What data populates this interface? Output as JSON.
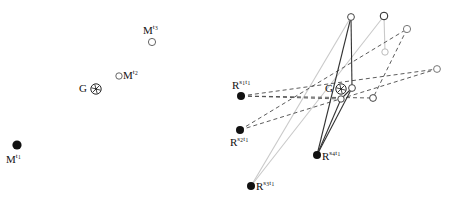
{
  "figure": {
    "type": "diagram",
    "kind": "point-set-correspondence-diagram",
    "background": "#ffffff",
    "width": 454,
    "height": 203,
    "panels": [
      "left",
      "right"
    ]
  },
  "colors": {
    "ink": "#111111",
    "solid_edge": "#333333",
    "dashed_edge": "#4a4a4a",
    "light_edge": "#c9c9c9",
    "open_marker_stroke": "#555555",
    "filled_marker": "#111111",
    "panel_bg": "#ffffff"
  },
  "left_panel": {
    "name": "left-panel",
    "markers": [
      {
        "id": "M-t1",
        "label_base": "M",
        "label_sup": "t",
        "label_sub": "1",
        "style": "filled-circle",
        "x": 17,
        "y": 145,
        "r": 4.6,
        "label_x": 6,
        "label_y": 153
      },
      {
        "id": "G-star",
        "label_base": "G",
        "label_sup": "",
        "label_sub": "",
        "style": "circled-asterisk",
        "x": 96,
        "y": 89,
        "r": 5.2,
        "label_x": 79,
        "label_y": 83
      },
      {
        "id": "M-t2",
        "label_base": "M",
        "label_sup": "t",
        "label_sub": "2",
        "style": "open-circle",
        "x": 119,
        "y": 76,
        "r": 3.2,
        "label_x": 123,
        "label_y": 69
      },
      {
        "id": "M-t3",
        "label_base": "M",
        "label_sup": "t",
        "label_sub": "3",
        "style": "open-circle",
        "x": 152,
        "y": 42,
        "r": 3.6,
        "label_x": 143,
        "label_y": 24
      }
    ]
  },
  "right_panel": {
    "name": "right-panel",
    "markers": [
      {
        "id": "R-s1t1",
        "label_base": "R",
        "label_sup": "s",
        "label_sub": "1",
        "label_sup2": "t",
        "label_sub2": "1",
        "style": "filled-circle",
        "x": 241,
        "y": 96,
        "r": 4.0,
        "label_x": 232,
        "label_y": 79
      },
      {
        "id": "R-s2t1",
        "label_base": "R",
        "label_sup": "s",
        "label_sub": "2",
        "label_sup2": "t",
        "label_sub2": "1",
        "style": "filled-circle",
        "x": 240,
        "y": 130,
        "r": 4.0,
        "label_x": 230,
        "label_y": 136
      },
      {
        "id": "R-s3t1",
        "label_base": "R",
        "label_sup": "s",
        "label_sub": "3",
        "label_sup2": "t",
        "label_sub2": "1",
        "style": "filled-circle",
        "x": 251,
        "y": 186,
        "r": 4.0,
        "label_x": 256,
        "label_y": 180
      },
      {
        "id": "R-s4t1",
        "label_base": "R",
        "label_sup": "s",
        "label_sub": "4",
        "label_sup2": "t",
        "label_sub2": "1",
        "style": "filled-circle",
        "x": 317,
        "y": 155,
        "r": 4.0,
        "label_x": 322,
        "label_y": 150
      },
      {
        "id": "G-star-right",
        "label_base": "G",
        "label_sup": "",
        "label_sub": "",
        "style": "circled-asterisk",
        "x": 341,
        "y": 89,
        "r": 5.2,
        "label_x": 325,
        "label_y": 83
      }
    ],
    "open_nodes": [
      {
        "id": "node-top-a",
        "x": 351,
        "y": 17,
        "r": 3.4,
        "tone": "dark"
      },
      {
        "id": "node-top-b",
        "x": 384,
        "y": 16,
        "r": 3.8,
        "tone": "darker"
      },
      {
        "id": "node-top-c",
        "x": 407,
        "y": 29,
        "r": 3.6,
        "tone": "mid"
      },
      {
        "id": "node-mid-a",
        "x": 385,
        "y": 52,
        "r": 3.2,
        "tone": "light"
      },
      {
        "id": "node-right",
        "x": 437,
        "y": 69,
        "r": 3.4,
        "tone": "mid"
      },
      {
        "id": "node-center",
        "x": 352,
        "y": 88,
        "r": 3.4,
        "tone": "dark"
      },
      {
        "id": "node-lower-a",
        "x": 341,
        "y": 99,
        "r": 3.2,
        "tone": "dark"
      },
      {
        "id": "node-lower-b",
        "x": 373,
        "y": 98,
        "r": 3.4,
        "tone": "dark"
      }
    ],
    "edges_solid": [
      {
        "from": "R-s4t1",
        "to": "node-top-a"
      },
      {
        "from": "R-s4t1",
        "to": "node-center"
      },
      {
        "from": "node-top-a",
        "to": "node-center"
      },
      {
        "from": "node-center",
        "to": "node-lower-a"
      },
      {
        "from": "node-lower-a",
        "to": "R-s4t1"
      }
    ],
    "edges_dashed": [
      {
        "from": "R-s1t1",
        "to": "node-lower-b"
      },
      {
        "from": "R-s1t1",
        "to": "node-right"
      },
      {
        "from": "R-s2t1",
        "to": "node-top-c"
      },
      {
        "from": "R-s2t1",
        "to": "node-right"
      },
      {
        "from": "node-top-c",
        "to": "node-lower-b"
      },
      {
        "from": "R-s1t1",
        "to": "node-lower-a"
      }
    ],
    "edges_light": [
      {
        "from": "R-s3t1",
        "to": "node-top-b"
      },
      {
        "from": "R-s3t1",
        "to": "node-top-a"
      },
      {
        "from": "node-top-b",
        "to": "node-mid-a"
      }
    ]
  }
}
